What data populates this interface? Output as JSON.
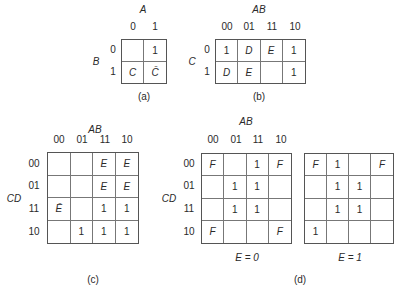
{
  "maps": {
    "a": {
      "caption": "(a)",
      "col_var": "A",
      "row_var": "B",
      "col_labels": [
        "0",
        "1"
      ],
      "row_labels": [
        "0",
        "1"
      ],
      "cells": [
        [
          "",
          "1"
        ],
        [
          "C",
          "C̄"
        ]
      ]
    },
    "b": {
      "caption": "(b)",
      "col_var": "AB",
      "row_var": "C",
      "col_labels": [
        "00",
        "01",
        "11",
        "10"
      ],
      "row_labels": [
        "0",
        "1"
      ],
      "cells": [
        [
          "1",
          "D",
          "E",
          "1"
        ],
        [
          "D",
          "E",
          "",
          "1"
        ]
      ]
    },
    "c": {
      "caption": "(c)",
      "col_var": "AB",
      "row_var": "CD",
      "col_labels": [
        "00",
        "01",
        "11",
        "10"
      ],
      "row_labels": [
        "00",
        "01",
        "11",
        "10"
      ],
      "cells": [
        [
          "",
          "",
          "E",
          "E"
        ],
        [
          "",
          "",
          "E",
          "E"
        ],
        [
          "Ē",
          "",
          "1",
          "1"
        ],
        [
          "",
          "1",
          "1",
          "1"
        ]
      ]
    },
    "d": {
      "caption": "(d)",
      "col_var": "AB",
      "row_var": "CD",
      "col_labels": [
        "00",
        "01",
        "11",
        "10"
      ],
      "row_labels": [
        "00",
        "01",
        "11",
        "10"
      ],
      "left": {
        "label": "E = 0",
        "cells": [
          [
            "F",
            "",
            "1",
            "F"
          ],
          [
            "",
            "1",
            "1",
            ""
          ],
          [
            "",
            "1",
            "1",
            ""
          ],
          [
            "F",
            "",
            "",
            "F"
          ]
        ]
      },
      "right": {
        "label": "E = 1",
        "cells": [
          [
            "F",
            "1",
            "",
            "F"
          ],
          [
            "",
            "1",
            "1",
            ""
          ],
          [
            "",
            "1",
            "1",
            ""
          ],
          [
            "1",
            "",
            "",
            ""
          ]
        ]
      }
    }
  }
}
